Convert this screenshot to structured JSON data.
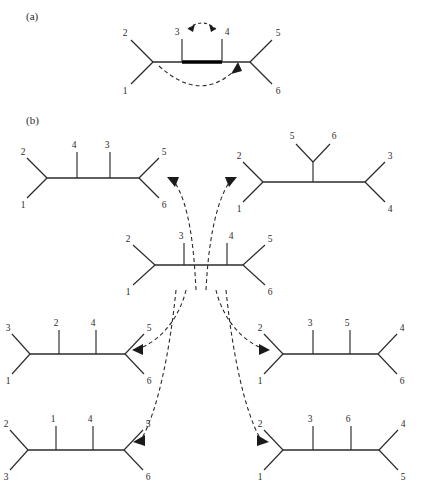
{
  "figure": {
    "panels": [
      {
        "id": "a",
        "label": "(a)"
      },
      {
        "id": "b",
        "label": "(b)"
      }
    ]
  },
  "panel_a": {
    "label": "(a)",
    "description": "Species tree with a highlighted horizontal transfer edge",
    "tree": {
      "name": "species-tree-with-transfer",
      "top_labels": [
        "2",
        "3",
        "4",
        "5"
      ],
      "bottom_labels": [
        "1",
        "6"
      ],
      "highlighted_segment_label": "bold-internal-branch"
    },
    "arcs": [
      {
        "name": "arc-3-to-4",
        "style": "double-headed",
        "from": "3",
        "to": "4"
      },
      {
        "name": "arc-left-to-right",
        "style": "single-headed",
        "from": "left-node",
        "to": "right-node"
      }
    ]
  },
  "panel_b": {
    "label": "(b)",
    "description": "Central tree with six alternative resolutions connected by dashed arrows",
    "center_tree": {
      "name": "center-tree",
      "top_labels": [
        "2",
        "3",
        "4",
        "5"
      ],
      "bottom_labels": [
        "1",
        "6"
      ]
    },
    "derived_trees": [
      {
        "name": "tree-top-left",
        "position": "top-left",
        "layout": "ladder",
        "left_fork": {
          "top": "2",
          "bottom": "1"
        },
        "inner_top": [
          "4",
          "3"
        ],
        "right_fork": {
          "top": "5",
          "bottom": "6"
        },
        "arrow": {
          "name": "arrow-to-top-left",
          "direction": "left"
        }
      },
      {
        "name": "tree-top-right",
        "position": "top-right",
        "layout": "clade-stalk",
        "left_fork": {
          "top": "2",
          "bottom": "1"
        },
        "stalk_clade": [
          "5",
          "6"
        ],
        "right_fork": {
          "top": "3",
          "bottom": "4"
        },
        "arrow": {
          "name": "arrow-to-top-right",
          "direction": "right"
        }
      },
      {
        "name": "tree-middle-left",
        "position": "middle-left",
        "layout": "ladder",
        "left_fork": {
          "top": "3",
          "bottom": "1"
        },
        "inner_top": [
          "2",
          "4"
        ],
        "right_fork": {
          "top": "5",
          "bottom": "6"
        },
        "arrow": {
          "name": "arrow-to-middle-left",
          "direction": "left"
        }
      },
      {
        "name": "tree-middle-right",
        "position": "middle-right",
        "layout": "ladder",
        "left_fork": {
          "top": "2",
          "bottom": "1"
        },
        "inner_top": [
          "3",
          "5"
        ],
        "right_fork": {
          "top": "4",
          "bottom": "6"
        },
        "arrow": {
          "name": "arrow-to-middle-right",
          "direction": "right"
        }
      },
      {
        "name": "tree-bottom-left",
        "position": "bottom-left",
        "layout": "ladder",
        "left_fork": {
          "top": "2",
          "bottom": "3"
        },
        "inner_top": [
          "1",
          "4"
        ],
        "right_fork": {
          "top": "5",
          "bottom": "6"
        },
        "arrow": {
          "name": "arrow-to-bottom-left",
          "direction": "left"
        }
      },
      {
        "name": "tree-bottom-right",
        "position": "bottom-right",
        "layout": "ladder",
        "left_fork": {
          "top": "2",
          "bottom": "1"
        },
        "inner_top": [
          "3",
          "6"
        ],
        "right_fork": {
          "top": "4",
          "bottom": "5"
        },
        "arrow": {
          "name": "arrow-to-bottom-right",
          "direction": "right"
        }
      }
    ]
  },
  "labels": {
    "panel_a": "(a)",
    "panel_b": "(b)",
    "a_t2": "2",
    "a_t3": "3",
    "a_t4": "4",
    "a_t5": "5",
    "a_t1": "1",
    "a_t6": "6",
    "c_t2": "2",
    "c_t3": "3",
    "c_t4": "4",
    "c_t5": "5",
    "c_t1": "1",
    "c_t6": "6",
    "tl_1": "2",
    "tl_2": "4",
    "tl_3": "3",
    "tl_4": "5",
    "tl_5": "1",
    "tl_6": "6",
    "tr_1": "2",
    "tr_2": "5",
    "tr_3": "6",
    "tr_4": "3",
    "tr_5": "1",
    "tr_6": "4",
    "ml_1": "3",
    "ml_2": "2",
    "ml_3": "4",
    "ml_4": "5",
    "ml_5": "1",
    "ml_6": "6",
    "mr_1": "2",
    "mr_2": "3",
    "mr_3": "5",
    "mr_4": "4",
    "mr_5": "1",
    "mr_6": "6",
    "bl_1": "2",
    "bl_2": "1",
    "bl_3": "4",
    "bl_4": "5",
    "bl_5": "3",
    "bl_6": "6",
    "br_1": "2",
    "br_2": "3",
    "br_3": "6",
    "br_4": "4",
    "br_5": "1",
    "br_6": "5"
  },
  "colors": {
    "ink": "#2b2b2b",
    "bold_branch": "#000000",
    "background": "#ffffff"
  }
}
